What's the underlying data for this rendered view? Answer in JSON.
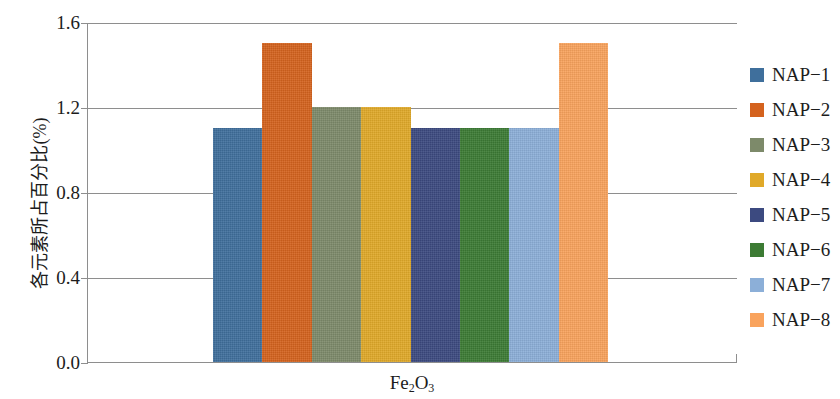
{
  "chart_data": {
    "type": "bar",
    "title": "",
    "xlabel": "Fe2O3",
    "xlabel_html": "Fe₂O₃",
    "ylabel": "各元素所占百分比(%)",
    "categories": [
      "NAP-1",
      "NAP-2",
      "NAP-3",
      "NAP-4",
      "NAP-5",
      "NAP-6",
      "NAP-7",
      "NAP-8"
    ],
    "values": [
      1.1,
      1.5,
      1.2,
      1.2,
      1.1,
      1.1,
      1.1,
      1.5
    ],
    "group_label": "Fe₂O₃",
    "ylim": [
      0.0,
      1.6
    ],
    "yticks": [
      "0.0",
      "0.4",
      "0.8",
      "1.2",
      "1.6"
    ],
    "ytick_values": [
      0.0,
      0.4,
      0.8,
      1.2,
      1.6
    ],
    "xticks": [],
    "grid": "horizontal",
    "legend_position": "right",
    "series": [
      {
        "name": "NAP-1",
        "value": 1.1,
        "color": "#3f6f9c"
      },
      {
        "name": "NAP-2",
        "value": 1.5,
        "color": "#d4621e"
      },
      {
        "name": "NAP-3",
        "value": 1.2,
        "color": "#7d8a6a"
      },
      {
        "name": "NAP-4",
        "value": 1.2,
        "color": "#e0a929"
      },
      {
        "name": "NAP-5",
        "value": 1.1,
        "color": "#3c4a80"
      },
      {
        "name": "NAP-6",
        "value": 1.1,
        "color": "#3c7b34"
      },
      {
        "name": "NAP-7",
        "value": 1.1,
        "color": "#8cafd8"
      },
      {
        "name": "NAP-8",
        "value": 1.5,
        "color": "#f9a35d"
      }
    ]
  },
  "axis": {
    "ylabel": "各元素所占百分比(%)",
    "ytick_0": "0.0",
    "ytick_1": "0.4",
    "ytick_2": "0.8",
    "ytick_3": "1.2",
    "ytick_4": "1.6"
  },
  "legend": {
    "items": [
      {
        "label": "NAP-1",
        "color": "#3f6f9c"
      },
      {
        "label": "NAP-2",
        "color": "#d4621e"
      },
      {
        "label": "NAP-3",
        "color": "#7d8a6a"
      },
      {
        "label": "NAP-4",
        "color": "#e0a929"
      },
      {
        "label": "NAP-5",
        "color": "#3c4a80"
      },
      {
        "label": "NAP-6",
        "color": "#3c7b34"
      },
      {
        "label": "NAP-7",
        "color": "#8cafd8"
      },
      {
        "label": "NAP-8",
        "color": "#f9a35d"
      }
    ]
  },
  "colors": {
    "axis": "#8e8e8e",
    "text": "#1c1c1c",
    "background": "#ffffff"
  }
}
